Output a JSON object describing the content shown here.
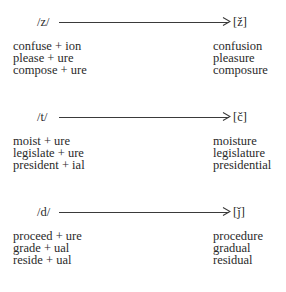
{
  "groups": [
    {
      "source": "/z/",
      "target": "[ž]",
      "examples": [
        {
          "input": "confuse + ion",
          "output": "confusion"
        },
        {
          "input": "please + ure",
          "output": "pleasure"
        },
        {
          "input": "compose + ure",
          "output": "composure"
        }
      ]
    },
    {
      "source": "/t/",
      "target": "[č]",
      "examples": [
        {
          "input": "moist + ure",
          "output": "moisture"
        },
        {
          "input": "legislate + ure",
          "output": "legislature"
        },
        {
          "input": "president + ial",
          "output": "presidential"
        }
      ]
    },
    {
      "source": "/d/",
      "target": "[ǰ]",
      "examples": [
        {
          "input": "proceed + ure",
          "output": "procedure"
        },
        {
          "input": "grade + ual",
          "output": "gradual"
        },
        {
          "input": "reside + ual",
          "output": "residual"
        }
      ]
    }
  ]
}
